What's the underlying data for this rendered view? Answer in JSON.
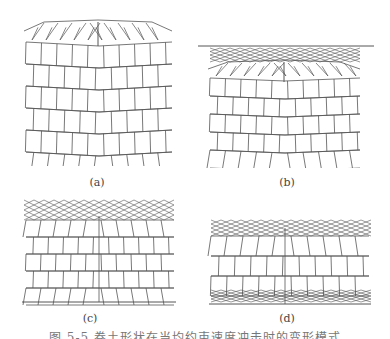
{
  "figure": {
    "panels": [
      {
        "id": "a",
        "label": "(a)",
        "description": "Brick-pattern block lattice with fan-shaped deformation only in top row"
      },
      {
        "id": "b",
        "label": "(b)",
        "description": "Lattice under top plate with deformation in upper rows and tilting bottom row"
      },
      {
        "id": "c",
        "label": "(c)",
        "description": "Lattice with severe crushing in top layers and central vertical buckling"
      },
      {
        "id": "d",
        "label": "(d)",
        "description": "Lattice with crushing at top and bottom layers and central shear band"
      }
    ],
    "caption": "图 5-5  卷土形状在当均约束速度冲击时的变形模式"
  },
  "style": {
    "line_color": "#555555",
    "background": "#ffffff"
  }
}
